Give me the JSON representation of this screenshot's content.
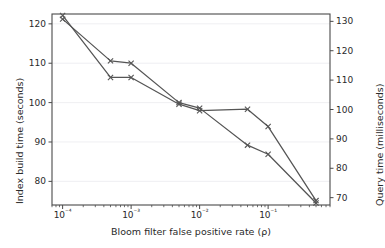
{
  "chart_data": {
    "type": "line",
    "title": "",
    "xlabel": "Bloom filter false positive rate (ρ)",
    "xscale": "log",
    "xlim": [
      7e-05,
      0.8
    ],
    "xticks": [
      0.0001,
      0.001,
      0.01,
      0.1
    ],
    "xtick_labels": [
      "10⁻⁴",
      "10⁻³",
      "10⁻²",
      "10⁻¹"
    ],
    "grid": true,
    "grid_axis": "y",
    "legend": "none",
    "marker": "x",
    "line_color": "#555555",
    "axes": [
      {
        "position": "left",
        "ylabel": "Index build time (seconds)",
        "ylim": [
          74,
          122.5
        ],
        "yticks": [
          80,
          90,
          100,
          110,
          120
        ],
        "ytick_labels": [
          "80",
          "90",
          "100",
          "110",
          "120"
        ]
      },
      {
        "position": "right",
        "ylabel": "Query time (milliseconds)",
        "ylim": [
          67.5,
          132.5
        ],
        "yticks": [
          70,
          80,
          90,
          100,
          110,
          120,
          130
        ],
        "ytick_labels": [
          "70",
          "80",
          "90",
          "100",
          "110",
          "120",
          "130"
        ]
      }
    ],
    "series": [
      {
        "name": "Index build time",
        "axis": "left",
        "unit": "seconds",
        "x": [
          0.0001,
          0.0005,
          0.001,
          0.005,
          0.01,
          0.05,
          0.1,
          0.5
        ],
        "values": [
          121.2,
          110.6,
          110.0,
          100.0,
          98.6,
          89.2,
          86.9,
          74.5
        ]
      },
      {
        "name": "Query time",
        "axis": "right",
        "unit": "milliseconds",
        "x": [
          0.0001,
          0.0005,
          0.001,
          0.005,
          0.01,
          0.05,
          0.1,
          0.5
        ],
        "values": [
          132.0,
          110.9,
          110.9,
          101.8,
          99.6,
          100.1,
          94.2,
          69.0
        ]
      }
    ]
  }
}
